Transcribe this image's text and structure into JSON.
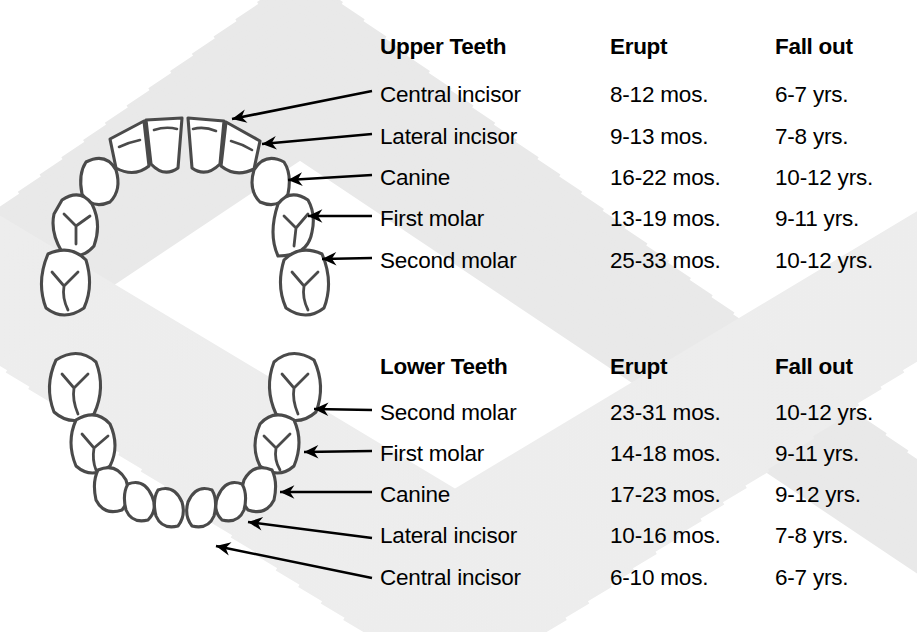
{
  "chart_title": "Primary Teeth Eruption and Shedding Chart",
  "background": {
    "pattern": "chevron-moire",
    "base_color": "#ffffff",
    "line_color": "#e8e8e8"
  },
  "colors": {
    "text": "#000000",
    "tooth_outline": "#4a4a4a",
    "tooth_fill": "#ffffff",
    "arrow": "#000000"
  },
  "sections": [
    {
      "id": "upper",
      "headers": {
        "name": "Upper Teeth",
        "erupt": "Erupt",
        "fall_out": "Fall out"
      },
      "rows": [
        {
          "name": "Central incisor",
          "erupt": "8-12 mos.",
          "fall_out": "6-7 yrs."
        },
        {
          "name": "Lateral incisor",
          "erupt": "9-13 mos.",
          "fall_out": "7-8 yrs."
        },
        {
          "name": "Canine",
          "erupt": "16-22 mos.",
          "fall_out": "10-12 yrs."
        },
        {
          "name": "First molar",
          "erupt": "13-19 mos.",
          "fall_out": "9-11 yrs."
        },
        {
          "name": "Second molar",
          "erupt": "25-33 mos.",
          "fall_out": "10-12 yrs."
        }
      ]
    },
    {
      "id": "lower",
      "headers": {
        "name": "Lower Teeth",
        "erupt": "Erupt",
        "fall_out": "Fall out"
      },
      "rows": [
        {
          "name": "Second molar",
          "erupt": "23-31 mos.",
          "fall_out": "10-12 yrs."
        },
        {
          "name": "First molar",
          "erupt": "14-18 mos.",
          "fall_out": "9-11 yrs."
        },
        {
          "name": "Canine",
          "erupt": "17-23 mos.",
          "fall_out": "9-12 yrs."
        },
        {
          "name": "Lateral incisor",
          "erupt": "10-16 mos.",
          "fall_out": "7-8 yrs."
        },
        {
          "name": "Central incisor",
          "erupt": "6-10 mos.",
          "fall_out": "6-7 yrs."
        }
      ]
    }
  ],
  "diagrams": {
    "upper_arch": {
      "label": "upper dental arch, 10 primary teeth, U-shape opening downward",
      "tooth_count": 10,
      "teeth": [
        "second-molar-left",
        "first-molar-left",
        "canine-left",
        "lateral-incisor-left",
        "central-incisor-left",
        "central-incisor-right",
        "lateral-incisor-right",
        "canine-right",
        "first-molar-right",
        "second-molar-right"
      ]
    },
    "lower_arch": {
      "label": "lower dental arch, 10 primary teeth, U-shape opening upward",
      "tooth_count": 10,
      "teeth": [
        "second-molar-left",
        "first-molar-left",
        "canine-left",
        "lateral-incisor-left",
        "central-incisor-left",
        "central-incisor-right",
        "lateral-incisor-right",
        "canine-right",
        "first-molar-right",
        "second-molar-right"
      ]
    }
  }
}
